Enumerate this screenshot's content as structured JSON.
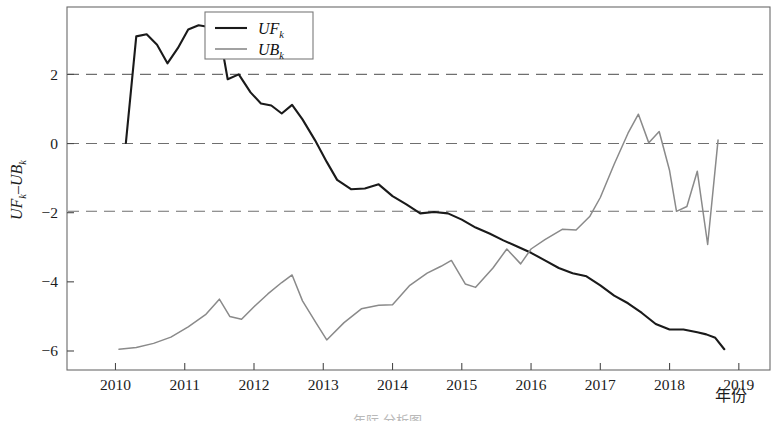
{
  "chart_data": {
    "type": "line",
    "title": "",
    "xlabel": "年份",
    "ylabel": "UFk-UBk",
    "ylabel_parts": {
      "a": "UF",
      "a_sub": "k",
      "dash": "–",
      "b": "UB",
      "b_sub": "k"
    },
    "xlim": [
      2009.3,
      2019.45
    ],
    "ylim": [
      -6.55,
      3.95
    ],
    "xticks": [
      "2010",
      "2011",
      "2012",
      "2013",
      "2014",
      "2015",
      "2016",
      "2017",
      "2018",
      "2019"
    ],
    "xtick_values": [
      2010,
      2011,
      2012,
      2013,
      2014,
      2015,
      2016,
      2017,
      2018,
      2019
    ],
    "yticks": [
      "2",
      "0",
      "−2",
      "−4",
      "−6"
    ],
    "ytick_values": [
      2,
      0,
      -2,
      -4,
      -6
    ],
    "grid": "horizontal-dashed",
    "gridlines": [
      2.0,
      0.0,
      -1.96
    ],
    "legend_position": "top-center",
    "legend": [
      {
        "label": "UF",
        "sub": "k",
        "color": "#1a1a1a",
        "width": 2.1
      },
      {
        "label": "UB",
        "sub": "k",
        "color": "#8a8a8a",
        "width": 1.6
      }
    ],
    "series": [
      {
        "name": "UFk",
        "color": "#1a1a1a",
        "x": [
          2010.15,
          2010.3,
          2010.45,
          2010.6,
          2010.75,
          2010.9,
          2011.05,
          2011.2,
          2011.35,
          2011.5,
          2011.62,
          2011.78,
          2011.95,
          2012.1,
          2012.25,
          2012.4,
          2012.55,
          2012.7,
          2012.88,
          2013.05,
          2013.2,
          2013.4,
          2013.6,
          2013.8,
          2014.0,
          2014.2,
          2014.4,
          2014.6,
          2014.8,
          2015.0,
          2015.2,
          2015.4,
          2015.6,
          2015.8,
          2016.0,
          2016.2,
          2016.4,
          2016.6,
          2016.8,
          2017.0,
          2017.2,
          2017.4,
          2017.6,
          2017.8,
          2018.0,
          2018.2,
          2018.4
        ],
        "y": [
          0.02,
          3.1,
          3.16,
          2.86,
          2.32,
          2.76,
          3.3,
          3.42,
          3.37,
          3.22,
          1.86,
          2.0,
          1.48,
          1.16,
          1.1,
          0.87,
          1.12,
          0.7,
          0.1,
          -0.53,
          -1.05,
          -1.32,
          -1.3,
          -1.18,
          -1.52,
          -1.76,
          -2.02,
          -1.98,
          -2.02,
          -2.2,
          -2.43,
          -2.6,
          -2.8,
          -2.98,
          -3.16,
          -3.38,
          -3.6,
          -3.75,
          -3.84,
          -4.1,
          -4.4,
          -4.62,
          -4.9,
          -5.22,
          -5.38,
          -5.38,
          -5.46
        ],
        "y_extra_tail": [
          -5.52,
          -5.62,
          -5.95
        ]
      },
      {
        "name": "UBk",
        "color": "#8a8a8a",
        "x": [
          2010.05,
          2010.3,
          2010.55,
          2010.8,
          2011.05,
          2011.3,
          2011.5,
          2011.65,
          2011.82,
          2012.0,
          2012.2,
          2012.4,
          2012.55,
          2012.7,
          2012.9,
          2013.05,
          2013.3,
          2013.55,
          2013.8,
          2014.0,
          2014.25,
          2014.5,
          2014.7,
          2014.85,
          2015.05,
          2015.2,
          2015.45,
          2015.65,
          2015.85,
          2016.0,
          2016.2,
          2016.45,
          2016.65,
          2016.85,
          2017.0,
          2017.2,
          2017.4,
          2017.55,
          2017.7,
          2017.85,
          2018.0,
          2018.1,
          2018.25,
          2018.4,
          2018.55,
          2018.7
        ],
        "y": [
          -5.95,
          -5.9,
          -5.78,
          -5.6,
          -5.3,
          -4.95,
          -4.5,
          -5.0,
          -5.08,
          -4.72,
          -4.35,
          -4.02,
          -3.8,
          -4.55,
          -5.2,
          -5.68,
          -5.18,
          -4.78,
          -4.68,
          -4.66,
          -4.1,
          -3.75,
          -3.55,
          -3.38,
          -4.06,
          -4.16,
          -3.6,
          -3.05,
          -3.48,
          -3.05,
          -2.78,
          -2.48,
          -2.5,
          -2.1,
          -1.56,
          -0.6,
          0.3,
          0.85,
          0.02,
          0.35,
          -0.78,
          -1.96,
          -1.82,
          -0.8,
          -2.92,
          0.1
        ]
      }
    ],
    "annotations": []
  },
  "axis": {
    "x_title": "年份",
    "frame_color": "#5a5a5a"
  },
  "caption": {
    "partial_text": "年际 分析图"
  }
}
